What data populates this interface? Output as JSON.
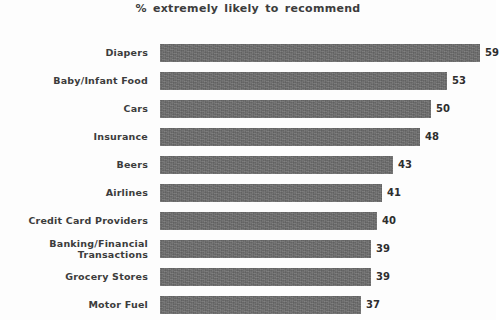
{
  "chart_data": {
    "type": "bar",
    "orientation": "horizontal",
    "title": "% extremely likely to recommend",
    "xlabel": "",
    "ylabel": "",
    "xlim": [
      0,
      62
    ],
    "grid": false,
    "legend": null,
    "categories": [
      "Diapers",
      "Baby/Infant Food",
      "Cars",
      "Insurance",
      "Beers",
      "Airlines",
      "Credit Card Providers",
      "Banking/Financial Transactions",
      "Grocery Stores",
      "Motor Fuel"
    ],
    "values": [
      59,
      53,
      50,
      48,
      43,
      41,
      40,
      39,
      39,
      37
    ],
    "value_labels": [
      "59",
      "53",
      "50",
      "48",
      "43",
      "41",
      "40",
      "39",
      "39",
      "37"
    ],
    "bar_color": "#6d6d6d",
    "text_color": "#3c3c3c"
  },
  "rows": [
    {
      "label_line1": "Diapers",
      "label_line2": "",
      "value": 59,
      "value_label": "59"
    },
    {
      "label_line1": "Baby/Infant Food",
      "label_line2": "",
      "value": 53,
      "value_label": "53"
    },
    {
      "label_line1": "Cars",
      "label_line2": "",
      "value": 50,
      "value_label": "50"
    },
    {
      "label_line1": "Insurance",
      "label_line2": "",
      "value": 48,
      "value_label": "48"
    },
    {
      "label_line1": "Beers",
      "label_line2": "",
      "value": 43,
      "value_label": "43"
    },
    {
      "label_line1": "Airlines",
      "label_line2": "",
      "value": 41,
      "value_label": "41"
    },
    {
      "label_line1": "Credit Card Providers",
      "label_line2": "",
      "value": 40,
      "value_label": "40"
    },
    {
      "label_line1": "Banking/Financial",
      "label_line2": "Transactions",
      "value": 39,
      "value_label": "39"
    },
    {
      "label_line1": "Grocery Stores",
      "label_line2": "",
      "value": 39,
      "value_label": "39"
    },
    {
      "label_line1": "Motor Fuel",
      "label_line2": "",
      "value": 37,
      "value_label": "37"
    }
  ]
}
